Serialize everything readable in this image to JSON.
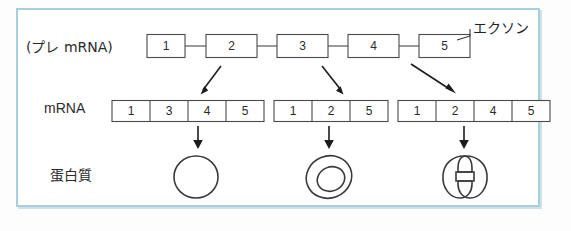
{
  "figure": {
    "title_hidden": "",
    "border_color": "#a8cfdd",
    "line_color": "#4a4a4a",
    "arrow_color": "#1c1c1c",
    "background": "#ffffff"
  },
  "rows": {
    "pre_mrna": {
      "label": "(プレ mRNA)",
      "annotation_label": "エクソン",
      "boxes": [
        {
          "num": "1"
        },
        {
          "num": "2"
        },
        {
          "num": "3"
        },
        {
          "num": "4"
        },
        {
          "num": "5"
        }
      ]
    },
    "mrna": {
      "label": "mRNA",
      "variants": [
        {
          "cells": [
            "1",
            "3",
            "4",
            "5"
          ]
        },
        {
          "cells": [
            "1",
            "2",
            "5"
          ]
        },
        {
          "cells": [
            "1",
            "2",
            "4",
            "5"
          ]
        }
      ]
    },
    "protein": {
      "label": "蛋白質",
      "shapes": [
        {
          "kind": "circle"
        },
        {
          "kind": "nested-ellipse"
        },
        {
          "kind": "bilobed"
        }
      ]
    }
  },
  "arrows": {
    "splice_arrows": [
      {
        "name": "splice-arrow-1"
      },
      {
        "name": "splice-arrow-2"
      },
      {
        "name": "splice-arrow-3"
      }
    ],
    "translate_arrows": [
      {
        "name": "translation-arrow-1"
      },
      {
        "name": "translation-arrow-2"
      },
      {
        "name": "translation-arrow-3"
      }
    ]
  }
}
